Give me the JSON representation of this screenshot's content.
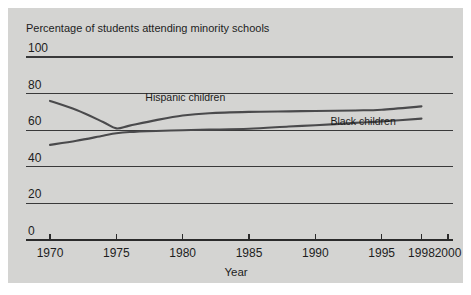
{
  "figure": {
    "panel_background": "#d4d4d2",
    "outer_background": "#ffffff",
    "line_color": "#4a4a4c",
    "axis_color": "#2b2b2b"
  },
  "chart_data": {
    "type": "line",
    "title": "Percentage of students attending minority schools",
    "subtitle": "",
    "xlabel": "Year",
    "ylabel": "",
    "xlim": [
      1968,
      2000
    ],
    "ylim": [
      0,
      100
    ],
    "grid": true,
    "gridlines_y": [
      0,
      20,
      40,
      60,
      80,
      100
    ],
    "legend_position": "inline-labels",
    "xticks": [
      1970,
      1975,
      1980,
      1985,
      1990,
      1995,
      1998,
      2000
    ],
    "xtick_labels": [
      "1970",
      "1975",
      "1980",
      "1985",
      "1990",
      "1995",
      "1998",
      "2000"
    ],
    "yticks": [
      0,
      20,
      40,
      60,
      80,
      100
    ],
    "ytick_labels": [
      "0",
      "20",
      "40",
      "60",
      "80",
      "100"
    ],
    "x": [
      1970,
      1972,
      1974,
      1975,
      1976,
      1978,
      1980,
      1982,
      1985,
      1988,
      1990,
      1993,
      1995,
      1998
    ],
    "series": [
      {
        "name": "Hispanic children",
        "label": "Hispanic children",
        "values": [
          76.0,
          71.0,
          64.5,
          61.0,
          62.5,
          65.5,
          68.0,
          69.3,
          70.0,
          70.3,
          70.5,
          70.8,
          71.2,
          73.0
        ]
      },
      {
        "name": "Black children",
        "label": "Black children",
        "values": [
          52.0,
          54.2,
          57.0,
          58.3,
          59.0,
          59.6,
          60.0,
          60.3,
          60.8,
          62.0,
          62.7,
          64.0,
          64.8,
          66.3
        ]
      }
    ],
    "annotations": [
      {
        "text": "Hispanic children",
        "x": 1980.2,
        "y": 76.2
      },
      {
        "text": "Black children",
        "x": 1993.6,
        "y": 62.8
      }
    ]
  }
}
